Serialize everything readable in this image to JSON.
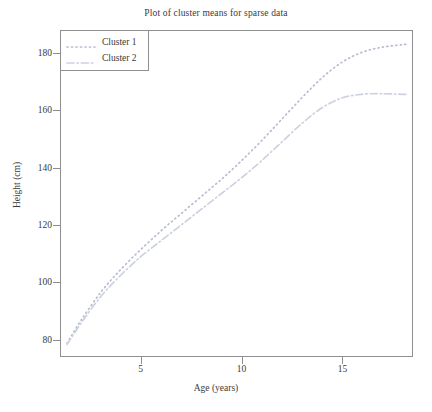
{
  "chart_data": {
    "type": "line",
    "title": "Plot of cluster means for sparse data",
    "xlabel": "Age (years)",
    "ylabel": "Height (cm)",
    "xlim": [
      1.0,
      18.5
    ],
    "ylim": [
      74,
      188
    ],
    "xticks": [
      5,
      10,
      15
    ],
    "xtick_labels": [
      "5",
      "10",
      "15"
    ],
    "yticks": [
      80,
      100,
      120,
      140,
      160,
      180
    ],
    "ytick_labels": [
      "80",
      "100",
      "120",
      "140",
      "160",
      "180"
    ],
    "grid": false,
    "legend_position": "upper left",
    "series": [
      {
        "name": "Cluster 1",
        "linestyle": "dotted",
        "color": "#b9bcd0",
        "x": [
          1.3,
          2,
          3,
          4,
          5,
          6,
          7,
          8,
          9,
          10,
          11,
          12,
          13,
          14,
          15,
          16,
          17,
          18,
          18.3
        ],
        "y": [
          78.5,
          86.5,
          96.5,
          104.5,
          111.5,
          118.0,
          124.0,
          130.0,
          136.0,
          142.5,
          149.5,
          157.0,
          164.5,
          171.5,
          177.0,
          180.5,
          182.3,
          183.2,
          183.4
        ]
      },
      {
        "name": "Cluster 2",
        "linestyle": "dashdot",
        "color": "#cdd2e0",
        "x": [
          1.3,
          2,
          3,
          4,
          5,
          6,
          7,
          8,
          9,
          10,
          11,
          12,
          13,
          14,
          15,
          16,
          17,
          18,
          18.3
        ],
        "y": [
          78.0,
          85.5,
          95.0,
          102.5,
          109.0,
          114.5,
          120.0,
          125.5,
          131.0,
          136.5,
          142.5,
          149.0,
          155.5,
          161.0,
          164.5,
          165.8,
          166.0,
          165.8,
          165.7
        ]
      }
    ]
  },
  "legend": {
    "entries": [
      {
        "label": "Cluster 1"
      },
      {
        "label": "Cluster 2"
      }
    ]
  },
  "colors": {
    "axis": "#8f8f8f",
    "text": "#3a3a3a",
    "cluster1": "#b9bcd0",
    "cluster2": "#cdd2e0",
    "background": "#ffffff"
  }
}
